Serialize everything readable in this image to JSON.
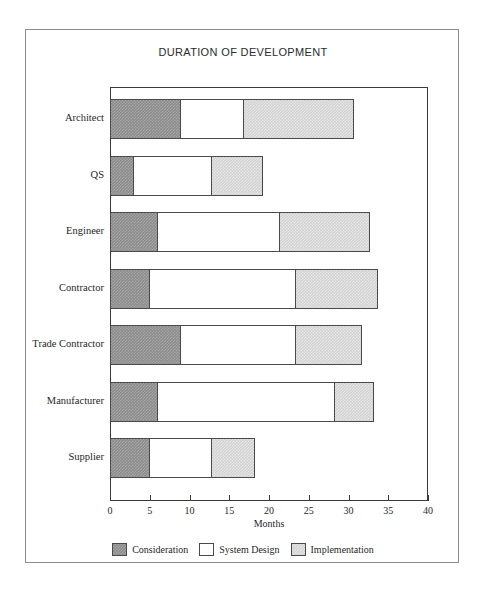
{
  "figure": {
    "title": "DURATION OF DEVELOPMENT"
  },
  "chart_data": {
    "type": "bar",
    "orientation": "horizontal",
    "stacked": true,
    "title": "DURATION OF DEVELOPMENT",
    "xlabel": "Months",
    "ylabel": "",
    "xlim": [
      0,
      40
    ],
    "xticks": [
      0,
      5,
      10,
      15,
      20,
      25,
      30,
      35,
      40
    ],
    "grid": false,
    "legend_position": "bottom",
    "categories": [
      "Architect",
      "QS",
      "Engineer",
      "Contractor",
      "Trade Contractor",
      "Manufacturer",
      "Supplier"
    ],
    "series": [
      {
        "name": "Consideration",
        "color": "#8c8c8c",
        "values": [
          9,
          3,
          6,
          5,
          9,
          6,
          5
        ]
      },
      {
        "name": "System Design",
        "color": "#ffffff",
        "values": [
          8,
          10,
          15.5,
          18.5,
          14.5,
          22.5,
          8
        ]
      },
      {
        "name": "Implementation",
        "color": "#d2d2d2",
        "values": [
          14,
          6.5,
          11.5,
          10.5,
          8.5,
          5,
          5.5
        ]
      }
    ],
    "cumulative_ends": [
      [
        9,
        17,
        31
      ],
      [
        3,
        13,
        19.5
      ],
      [
        6,
        21.5,
        33
      ],
      [
        5,
        23.5,
        34
      ],
      [
        9,
        23.5,
        32
      ],
      [
        6,
        28.5,
        33.5
      ],
      [
        5,
        13,
        18.5
      ]
    ],
    "totals": [
      31,
      19.5,
      33,
      34,
      32,
      33.5,
      18.5
    ]
  },
  "legend": {
    "items": [
      {
        "label": "Consideration",
        "color": "#8c8c8c"
      },
      {
        "label": "System Design",
        "color": "#ffffff"
      },
      {
        "label": "Implementation",
        "color": "#d2d2d2"
      }
    ]
  }
}
